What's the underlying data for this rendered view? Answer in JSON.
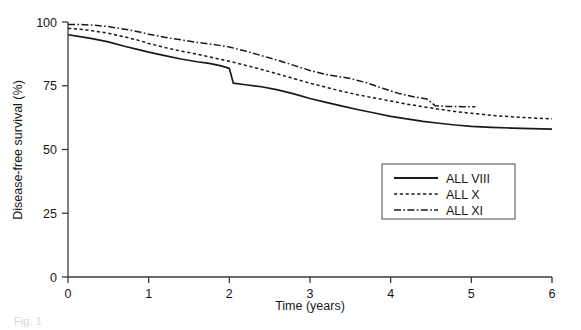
{
  "figure": {
    "background_color": "#ffffff",
    "line_color": "#1a1a1a",
    "axis_color": "#3a3a3a",
    "caption_partial": "Fig. 1"
  },
  "chart_data": {
    "type": "line",
    "title": "",
    "xlabel": "Time (years)",
    "ylabel": "Disease-free survival (%)",
    "xlim": [
      0,
      6
    ],
    "ylim": [
      0,
      100
    ],
    "xticks": [
      0,
      1,
      2,
      3,
      4,
      5,
      6
    ],
    "xticklabels": [
      "0",
      "1",
      "2",
      "3",
      "4",
      "5",
      "6"
    ],
    "yticks": [
      0,
      25,
      50,
      75,
      100
    ],
    "yticklabels": [
      "0",
      "25",
      "50",
      "75",
      "100"
    ],
    "grid": false,
    "legend_position": "center-right",
    "series": [
      {
        "name": "ALL VIII",
        "style": "solid",
        "x": [
          0,
          0.15,
          0.3,
          0.5,
          0.7,
          0.9,
          1.0,
          1.2,
          1.4,
          1.6,
          1.75,
          1.9,
          2.0,
          2.05,
          2.2,
          2.4,
          2.6,
          2.8,
          3.0,
          3.2,
          3.4,
          3.6,
          3.8,
          4.0,
          4.2,
          4.4,
          4.6,
          4.8,
          5.0,
          5.25,
          5.5,
          5.75,
          6.0
        ],
        "y": [
          95.0,
          94.3,
          93.5,
          92.2,
          90.5,
          89.0,
          88.2,
          86.8,
          85.5,
          84.4,
          83.8,
          82.8,
          81.8,
          76.0,
          75.4,
          74.6,
          73.4,
          71.8,
          70.0,
          68.5,
          67.0,
          65.6,
          64.3,
          63.0,
          62.0,
          61.0,
          60.3,
          59.6,
          59.1,
          58.7,
          58.4,
          58.2,
          58.0
        ]
      },
      {
        "name": "ALL X",
        "style": "dotted",
        "x": [
          0,
          0.15,
          0.3,
          0.5,
          0.7,
          0.9,
          1.0,
          1.2,
          1.4,
          1.6,
          1.8,
          2.0,
          2.2,
          2.4,
          2.6,
          2.8,
          3.0,
          3.2,
          3.4,
          3.6,
          3.8,
          4.0,
          4.2,
          4.4,
          4.6,
          4.8,
          5.0,
          5.25,
          5.5,
          5.75,
          6.0
        ],
        "y": [
          97.5,
          97.2,
          96.6,
          95.6,
          94.2,
          92.6,
          91.6,
          90.0,
          88.6,
          87.4,
          86.0,
          84.6,
          83.0,
          81.4,
          79.6,
          77.8,
          76.0,
          74.4,
          72.8,
          71.4,
          70.2,
          69.0,
          67.8,
          66.8,
          65.8,
          64.9,
          64.2,
          63.4,
          62.8,
          62.4,
          62.0
        ]
      },
      {
        "name": "ALL XI",
        "style": "dashdot",
        "x": [
          0,
          0.15,
          0.3,
          0.5,
          0.7,
          0.9,
          1.0,
          1.2,
          1.4,
          1.6,
          1.8,
          2.0,
          2.2,
          2.4,
          2.6,
          2.8,
          3.0,
          3.2,
          3.4,
          3.5,
          3.7,
          3.9,
          4.1,
          4.3,
          4.45,
          4.55,
          4.7,
          4.9,
          5.05
        ],
        "y": [
          99.0,
          99.0,
          98.8,
          98.2,
          97.2,
          96.0,
          95.2,
          94.0,
          93.0,
          92.0,
          91.2,
          90.2,
          88.6,
          86.8,
          85.0,
          83.0,
          81.0,
          79.4,
          78.4,
          77.8,
          76.2,
          74.0,
          72.0,
          70.6,
          69.8,
          67.2,
          66.9,
          66.8,
          66.8
        ]
      }
    ]
  },
  "legend": {
    "items": [
      {
        "label": "ALL VIII",
        "style": "solid"
      },
      {
        "label": "ALL X",
        "style": "dotted"
      },
      {
        "label": "ALL XI",
        "style": "dashdot"
      }
    ]
  }
}
